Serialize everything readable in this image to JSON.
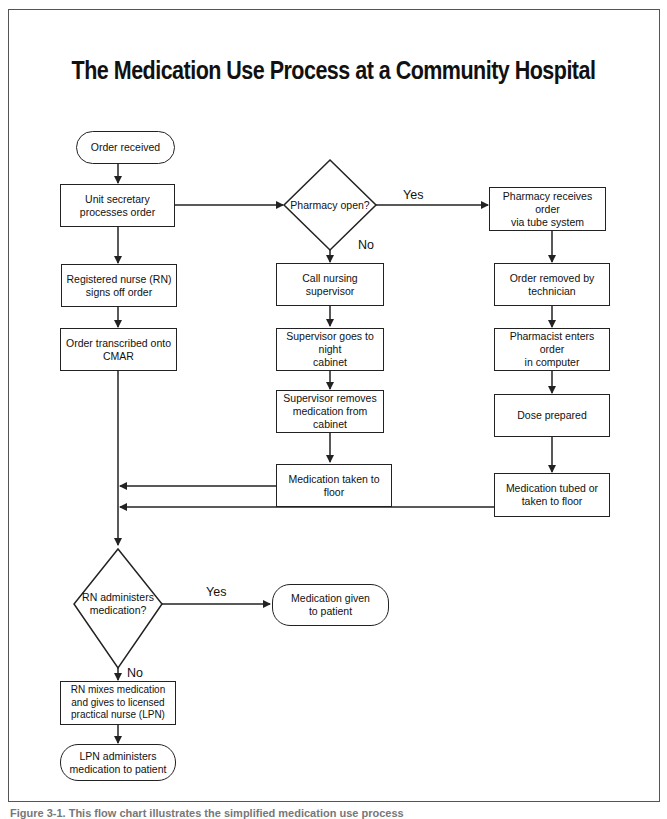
{
  "title": "The Medication Use Process at a Community Hospital",
  "nodes": {
    "order_received": "Order received",
    "unit_secretary": "Unit secretary\nprocesses order",
    "rn_signs_off": "Registered nurse (RN)\nsigns off order",
    "order_transcribed": "Order transcribed onto\nCMAR",
    "pharmacy_open": "Pharmacy open?",
    "call_supervisor": "Call nursing supervisor",
    "supervisor_goes": "Supervisor goes to night\ncabinet",
    "supervisor_removes": "Supervisor removes\nmedication from cabinet",
    "med_taken_floor": "Medication taken to floor",
    "pharmacy_receives": "Pharmacy receives order\nvia tube system",
    "order_removed": "Order removed by\ntechnician",
    "pharmacist_enters": "Pharmacist enters order\nin computer",
    "dose_prepared": "Dose prepared",
    "med_tubed": "Medication tubed or\ntaken to floor",
    "rn_administers": "RN administers\nmedication?",
    "med_given": "Medication given\nto patient",
    "rn_mixes": "RN mixes medication\nand gives to licensed\npractical nurse (LPN)",
    "lpn_administers": "LPN administers\nmedication to patient"
  },
  "edge_labels": {
    "pharmacy_yes": "Yes",
    "pharmacy_no": "No",
    "rn_yes": "Yes",
    "rn_no": "No"
  },
  "caption": "Figure 3-1. This flow chart illustrates the simplified medication use process"
}
